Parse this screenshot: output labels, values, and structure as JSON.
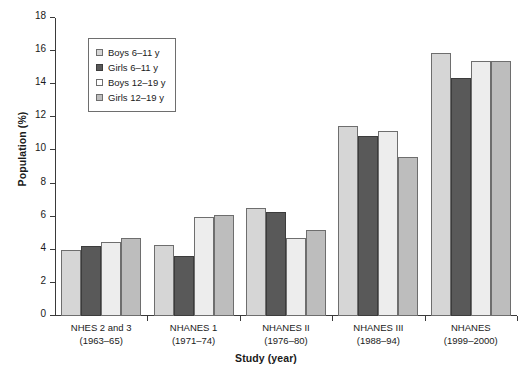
{
  "chart_data": {
    "type": "bar",
    "title": "",
    "xlabel": "Study (year)",
    "ylabel": "Population (%)",
    "ylim": [
      0,
      18
    ],
    "ytick_step": 2,
    "yticks": [
      0,
      2,
      4,
      6,
      8,
      10,
      12,
      14,
      16,
      18
    ],
    "ytick_labels": [
      "0",
      "2",
      "4",
      "6",
      "8",
      "10",
      "12",
      "14",
      "16",
      "18"
    ],
    "grid": false,
    "legend_position": "upper-left-inside",
    "categories": [
      "NHES 2 and 3\n(1963–65)",
      "NHANES 1\n(1971–74)",
      "NHANES II\n(1976–80)",
      "NHANES III\n(1988–94)",
      "NHANES\n(1999–2000)"
    ],
    "category_lines": [
      [
        "NHES 2 and 3",
        "(1963–65)"
      ],
      [
        "NHANES 1",
        "(1971–74)"
      ],
      [
        "NHANES II",
        "(1976–80)"
      ],
      [
        "NHANES III",
        "(1988–94)"
      ],
      [
        "NHANES",
        "(1999–2000)"
      ]
    ],
    "series": [
      {
        "name": "Boys 6–11 y",
        "color": "#d6d6d6",
        "values": [
          4.0,
          4.3,
          6.5,
          11.5,
          15.9
        ]
      },
      {
        "name": "Girls 6–11 y",
        "color": "#595959",
        "values": [
          4.2,
          3.6,
          6.3,
          10.9,
          14.4
        ]
      },
      {
        "name": "Boys 12–19 y",
        "color": "#ededed",
        "values": [
          4.5,
          6.0,
          4.7,
          11.2,
          15.4
        ]
      },
      {
        "name": "Girls 12–19 y",
        "color": "#bdbdbd",
        "values": [
          4.7,
          6.1,
          5.2,
          9.6,
          15.4
        ]
      }
    ]
  }
}
